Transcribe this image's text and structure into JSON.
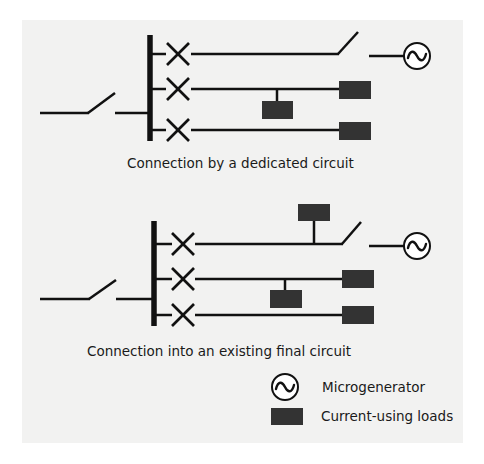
{
  "diagrams": [
    {
      "id": "dedicated",
      "caption": "Connection by a dedicated circuit",
      "circuits": [
        {
          "protective_device": "circuit-breaker",
          "ends_in": "isolator-switch-to-microgenerator",
          "loads": 0
        },
        {
          "protective_device": "circuit-breaker",
          "ends_in": "load",
          "loads": 2
        },
        {
          "protective_device": "circuit-breaker",
          "ends_in": "load",
          "loads": 1
        }
      ]
    },
    {
      "id": "existing",
      "caption": "Connection into an existing final circuit",
      "circuits": [
        {
          "protective_device": "circuit-breaker",
          "ends_in": "isolator-switch-to-microgenerator",
          "loads": 1
        },
        {
          "protective_device": "circuit-breaker",
          "ends_in": "load",
          "loads": 2
        },
        {
          "protective_device": "circuit-breaker",
          "ends_in": "load",
          "loads": 1
        }
      ]
    }
  ],
  "legend": {
    "items": [
      {
        "icon": "microgenerator-icon",
        "label": "Microgenerator"
      },
      {
        "icon": "load-icon",
        "label": "Current-using loads"
      }
    ]
  },
  "colors": {
    "line": "#111111",
    "load_fill": "#333333",
    "panel": "#f2f2f1"
  }
}
